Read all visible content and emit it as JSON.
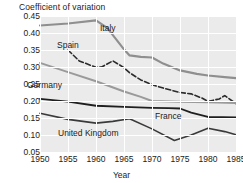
{
  "chart_data": {
    "type": "line",
    "title": "",
    "xlabel": "Year",
    "ylabel": "Coefficient of variation",
    "xlim": [
      1950,
      1985
    ],
    "ylim": [
      0.05,
      0.45
    ],
    "grid": true,
    "legend_position": "inline-labels",
    "xticks": [
      "1950",
      "1955",
      "1960",
      "1965",
      "1970",
      "1975",
      "1980",
      "1985"
    ],
    "xtick_values": [
      1950,
      1955,
      1960,
      1965,
      1970,
      1975,
      1980,
      1985
    ],
    "yticks": [
      "0.05",
      "0.10",
      "0.15",
      "0.20",
      "0.25",
      "0.30",
      "0.35",
      "0.40",
      "0.45"
    ],
    "ytick_values": [
      0.05,
      0.1,
      0.15,
      0.2,
      0.25,
      0.3,
      0.35,
      0.4,
      0.45
    ],
    "series": [
      {
        "name": "Italy",
        "color": "#8f8f8f",
        "style": "solid",
        "width": 2.2,
        "x": [
          1950,
          1955,
          1960,
          1962,
          1965,
          1966,
          1968,
          1970,
          1972,
          1975,
          1978,
          1980,
          1983,
          1985
        ],
        "values": [
          0.422,
          0.428,
          0.437,
          0.415,
          0.352,
          0.334,
          0.33,
          0.328,
          0.31,
          0.29,
          0.28,
          0.275,
          0.27,
          0.267
        ]
      },
      {
        "name": "Spain",
        "color": "#2b2b2b",
        "style": "dashed",
        "width": 1.6,
        "x": [
          1955,
          1957,
          1960,
          1961,
          1963,
          1965,
          1966,
          1968,
          1970,
          1972,
          1975,
          1977,
          1979,
          1980,
          1982,
          1983,
          1985
        ],
        "values": [
          0.35,
          0.318,
          0.299,
          0.3,
          0.318,
          0.298,
          0.283,
          0.262,
          0.248,
          0.238,
          0.225,
          0.221,
          0.208,
          0.199,
          0.206,
          0.216,
          0.192
        ]
      },
      {
        "name": "Germany",
        "color": "#9a9a9a",
        "style": "solid",
        "width": 2.0,
        "x": [
          1950,
          1955,
          1960,
          1965,
          1968,
          1970,
          1975,
          1980,
          1985
        ],
        "values": [
          0.312,
          0.285,
          0.258,
          0.228,
          0.212,
          0.2,
          0.198,
          0.196,
          0.194
        ]
      },
      {
        "name": "France",
        "color": "#1f1f1f",
        "style": "solid",
        "width": 1.8,
        "x": [
          1950,
          1955,
          1960,
          1965,
          1970,
          1973,
          1975,
          1977,
          1980,
          1985
        ],
        "values": [
          0.206,
          0.198,
          0.186,
          0.183,
          0.18,
          0.179,
          0.178,
          0.166,
          0.153,
          0.152
        ]
      },
      {
        "name": "United Kingdom",
        "color": "#3a3a3a",
        "style": "solid",
        "width": 1.6,
        "x": [
          1950,
          1955,
          1960,
          1963,
          1966,
          1970,
          1974,
          1977,
          1980,
          1983,
          1985
        ],
        "values": [
          0.164,
          0.146,
          0.135,
          0.14,
          0.148,
          0.118,
          0.084,
          0.1,
          0.12,
          0.11,
          0.101
        ]
      }
    ],
    "series_labels": [
      {
        "text": "Italy",
        "x_px": 100,
        "y_px": 23
      },
      {
        "text": "Spain",
        "x_px": 57,
        "y_px": 40
      },
      {
        "text": "Germany",
        "x_px": 27,
        "y_px": 80
      },
      {
        "text": "France",
        "x_px": 155,
        "y_px": 111
      },
      {
        "text": "United Kingdom",
        "x_px": 58,
        "y_px": 128
      }
    ]
  },
  "colors": {
    "plot_background": "#ebebeb",
    "gridline": "#ffffff",
    "text": "#1b1b1b",
    "page_background": "#ffffff"
  }
}
